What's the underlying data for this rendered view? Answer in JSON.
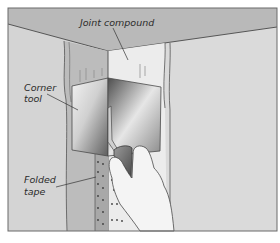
{
  "figure": {
    "type": "illustration",
    "labels": {
      "joint_compound": "Joint compound",
      "corner_tool_line1": "Corner",
      "corner_tool_line2": "tool",
      "folded_tape_line1": "Folded",
      "folded_tape_line2": "tape"
    },
    "colors": {
      "ceiling": "#b8b8b8",
      "left_wall": "#d6d6d6",
      "right_wall": "#dcdcdc",
      "corner_strip": "#bdbdbd",
      "compound_light": "#ececec",
      "tape": "#a9a9a9",
      "tool_dark": "#6e6e6e",
      "tool_light": "#f0f0f0",
      "hand": "#f4f4f4",
      "outline": "#4a4a4a"
    }
  }
}
